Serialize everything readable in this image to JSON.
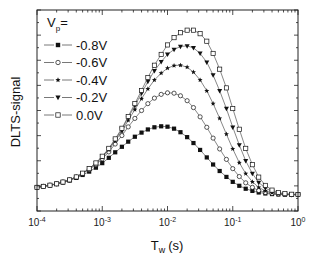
{
  "chart_data": {
    "type": "line",
    "title": "",
    "xlabel": "T_w (s)",
    "xlabel_main": "T",
    "xlabel_sub": "w",
    "xlabel_unit": "(s)",
    "ylabel": "DLTS-signal",
    "xscale": "log",
    "xlim": [
      0.0001,
      1
    ],
    "ylim": [
      0,
      1
    ],
    "grid": false,
    "x_ticks": [
      {
        "value": 0.0001,
        "base": "10",
        "exp": "-4"
      },
      {
        "value": 0.001,
        "base": "10",
        "exp": "-3"
      },
      {
        "value": 0.01,
        "base": "10",
        "exp": "-2"
      },
      {
        "value": 0.1,
        "base": "10",
        "exp": "-1"
      },
      {
        "value": 1,
        "base": "10",
        "exp": "0"
      }
    ],
    "y_ticks_labeled": false,
    "legend": {
      "title_main": "V",
      "title_sub": "p",
      "title_suffix": "=",
      "position": "upper left",
      "entries": [
        "-0.8V",
        "-0.6V",
        "-0.4V",
        "-0.2V",
        "0.0V"
      ]
    },
    "series": [
      {
        "name": "-0.8V",
        "marker": "filled-square",
        "x": [
          0.0001,
          0.000125,
          0.000158,
          0.0002,
          0.00025,
          0.000316,
          0.0004,
          0.0005,
          0.00063,
          0.0008,
          0.001,
          0.00126,
          0.00158,
          0.002,
          0.0025,
          0.00316,
          0.004,
          0.005,
          0.0063,
          0.008,
          0.01,
          0.0126,
          0.0158,
          0.02,
          0.025,
          0.0316,
          0.04,
          0.05,
          0.063,
          0.08,
          0.1,
          0.126,
          0.158,
          0.2,
          0.25,
          0.316,
          0.4,
          0.5,
          0.63,
          0.8,
          1.0
        ],
        "y": [
          0.12,
          0.125,
          0.13,
          0.137,
          0.145,
          0.155,
          0.168,
          0.183,
          0.2,
          0.22,
          0.243,
          0.27,
          0.298,
          0.326,
          0.352,
          0.377,
          0.398,
          0.414,
          0.425,
          0.43,
          0.428,
          0.418,
          0.4,
          0.375,
          0.345,
          0.31,
          0.272,
          0.236,
          0.203,
          0.173,
          0.148,
          0.128,
          0.113,
          0.102,
          0.094,
          0.089,
          0.086,
          0.084,
          0.083,
          0.083,
          0.083
        ]
      },
      {
        "name": "-0.6V",
        "marker": "open-circle",
        "x": [
          0.0001,
          0.000125,
          0.000158,
          0.0002,
          0.00025,
          0.000316,
          0.0004,
          0.0005,
          0.00063,
          0.0008,
          0.001,
          0.00126,
          0.00158,
          0.002,
          0.0025,
          0.00316,
          0.004,
          0.005,
          0.0063,
          0.008,
          0.01,
          0.0126,
          0.0158,
          0.02,
          0.025,
          0.0316,
          0.04,
          0.05,
          0.063,
          0.08,
          0.1,
          0.126,
          0.158,
          0.2,
          0.25,
          0.316,
          0.4,
          0.5,
          0.63,
          0.8,
          1.0
        ],
        "y": [
          0.12,
          0.125,
          0.131,
          0.138,
          0.147,
          0.158,
          0.172,
          0.19,
          0.21,
          0.235,
          0.265,
          0.3,
          0.34,
          0.383,
          0.427,
          0.47,
          0.51,
          0.545,
          0.573,
          0.592,
          0.6,
          0.598,
          0.585,
          0.56,
          0.525,
          0.478,
          0.425,
          0.37,
          0.315,
          0.262,
          0.215,
          0.175,
          0.143,
          0.12,
          0.104,
          0.094,
          0.089,
          0.086,
          0.084,
          0.083,
          0.083
        ]
      },
      {
        "name": "-0.4V",
        "marker": "star",
        "x": [
          0.0001,
          0.000125,
          0.000158,
          0.0002,
          0.00025,
          0.000316,
          0.0004,
          0.0005,
          0.00063,
          0.0008,
          0.001,
          0.00126,
          0.00158,
          0.002,
          0.0025,
          0.00316,
          0.004,
          0.005,
          0.0063,
          0.008,
          0.01,
          0.0126,
          0.0158,
          0.02,
          0.025,
          0.0316,
          0.04,
          0.05,
          0.063,
          0.08,
          0.1,
          0.126,
          0.158,
          0.2,
          0.25,
          0.316,
          0.4,
          0.5,
          0.63,
          0.8,
          1.0
        ],
        "y": [
          0.12,
          0.125,
          0.131,
          0.138,
          0.147,
          0.158,
          0.173,
          0.191,
          0.213,
          0.24,
          0.272,
          0.31,
          0.355,
          0.405,
          0.46,
          0.515,
          0.57,
          0.62,
          0.665,
          0.7,
          0.725,
          0.738,
          0.74,
          0.73,
          0.705,
          0.665,
          0.61,
          0.545,
          0.47,
          0.39,
          0.315,
          0.245,
          0.19,
          0.148,
          0.12,
          0.102,
          0.093,
          0.088,
          0.085,
          0.084,
          0.083
        ]
      },
      {
        "name": "-0.2V",
        "marker": "filled-triangle-down",
        "x": [
          0.0001,
          0.000125,
          0.000158,
          0.0002,
          0.00025,
          0.000316,
          0.0004,
          0.0005,
          0.00063,
          0.0008,
          0.001,
          0.00126,
          0.00158,
          0.002,
          0.0025,
          0.00316,
          0.004,
          0.005,
          0.0063,
          0.008,
          0.01,
          0.0126,
          0.0158,
          0.02,
          0.025,
          0.0316,
          0.04,
          0.05,
          0.063,
          0.08,
          0.1,
          0.126,
          0.158,
          0.2,
          0.25,
          0.316,
          0.4,
          0.5,
          0.63,
          0.8,
          1.0
        ],
        "y": [
          0.12,
          0.125,
          0.131,
          0.138,
          0.147,
          0.158,
          0.173,
          0.192,
          0.215,
          0.243,
          0.276,
          0.316,
          0.362,
          0.415,
          0.473,
          0.535,
          0.597,
          0.657,
          0.712,
          0.758,
          0.795,
          0.82,
          0.835,
          0.838,
          0.828,
          0.8,
          0.755,
          0.69,
          0.61,
          0.52,
          0.425,
          0.335,
          0.255,
          0.19,
          0.145,
          0.116,
          0.1,
          0.091,
          0.087,
          0.085,
          0.084
        ]
      },
      {
        "name": "0.0V",
        "marker": "open-square",
        "x": [
          0.0001,
          0.000125,
          0.000158,
          0.0002,
          0.00025,
          0.000316,
          0.0004,
          0.0005,
          0.00063,
          0.0008,
          0.001,
          0.00126,
          0.00158,
          0.002,
          0.0025,
          0.00316,
          0.004,
          0.005,
          0.0063,
          0.008,
          0.01,
          0.0126,
          0.0158,
          0.02,
          0.025,
          0.0316,
          0.04,
          0.05,
          0.063,
          0.08,
          0.1,
          0.126,
          0.158,
          0.2,
          0.25,
          0.316,
          0.4,
          0.5,
          0.63,
          0.8,
          1.0
        ],
        "y": [
          0.12,
          0.125,
          0.131,
          0.138,
          0.147,
          0.158,
          0.173,
          0.192,
          0.215,
          0.244,
          0.278,
          0.318,
          0.366,
          0.42,
          0.48,
          0.545,
          0.612,
          0.678,
          0.74,
          0.795,
          0.843,
          0.88,
          0.905,
          0.918,
          0.918,
          0.9,
          0.862,
          0.8,
          0.72,
          0.625,
          0.52,
          0.415,
          0.318,
          0.235,
          0.172,
          0.13,
          0.106,
          0.094,
          0.088,
          0.085,
          0.084
        ]
      }
    ]
  },
  "style": {
    "line_color": "#555555",
    "marker_color": "#111111",
    "axis_color": "#222222",
    "background": "#ffffff"
  },
  "layout": {
    "plot_left": 37,
    "plot_right": 298,
    "plot_top": 10,
    "plot_bottom": 211
  }
}
